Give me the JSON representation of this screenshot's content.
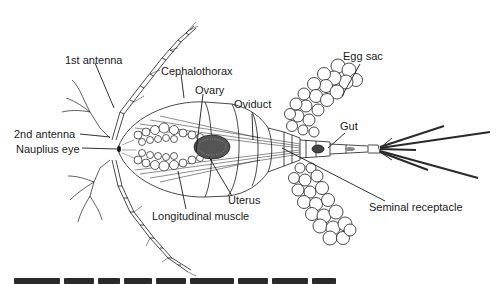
{
  "figure": {
    "labels": {
      "first_antenna": "1st antenna",
      "cephalothorax": "Cephalothorax",
      "ovary": "Ovary",
      "oviduct": "Oviduct",
      "egg_sac": "Egg sac",
      "gut": "Gut",
      "second_antenna": "2nd antenna",
      "nauplius_eye": "Nauplius eye",
      "uterus": "Uterus",
      "longitudinal_muscle": "Longitudinal muscle",
      "seminal_receptacle": "Seminal receptacle"
    },
    "caption_visible": false
  },
  "colors": {
    "ink": "#1a1a1a",
    "background": "#ffffff"
  }
}
